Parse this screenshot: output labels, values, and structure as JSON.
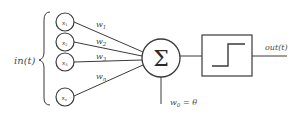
{
  "diagram": {
    "input_label": "in(t)",
    "inputs": [
      {
        "label": "x",
        "sub": "1"
      },
      {
        "label": "x",
        "sub": "2"
      },
      {
        "label": "x",
        "sub": "3"
      },
      {
        "label": "x",
        "sub": "n"
      }
    ],
    "weights": [
      {
        "label": "w",
        "sub": "1"
      },
      {
        "label": "w",
        "sub": "2"
      },
      {
        "label": "w",
        "sub": "3"
      },
      {
        "label": "w",
        "sub": "n"
      }
    ],
    "summation_symbol": "Σ",
    "bias_label": {
      "w": "w",
      "sub": "0",
      "rest": " =  θ"
    },
    "activation": "step-function",
    "output_label": "out(t)",
    "colors": {
      "line": "#3a3a3a",
      "text": "#4a4a4a",
      "background": "#ffffff"
    }
  }
}
